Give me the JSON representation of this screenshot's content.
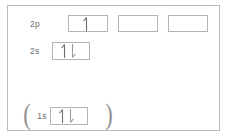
{
  "diagram": {
    "type": "electron-orbital-box-diagram",
    "border_color": "#b9b9b9",
    "box_border_color": "#b4b4b4",
    "ink_color": "#6e6e6e",
    "background": "#ffffff",
    "rows": [
      {
        "id": "2p",
        "label": "2p",
        "boxes": [
          {
            "electrons": [
              "up"
            ]
          },
          {
            "electrons": []
          },
          {
            "electrons": []
          }
        ]
      },
      {
        "id": "2s",
        "label": "2s",
        "boxes": [
          {
            "electrons": [
              "up",
              "down"
            ]
          }
        ]
      },
      {
        "id": "1s",
        "label": "1s",
        "bracket_left": "(",
        "bracket_right": ")",
        "boxes": [
          {
            "electrons": [
              "up",
              "down"
            ]
          }
        ]
      }
    ]
  }
}
